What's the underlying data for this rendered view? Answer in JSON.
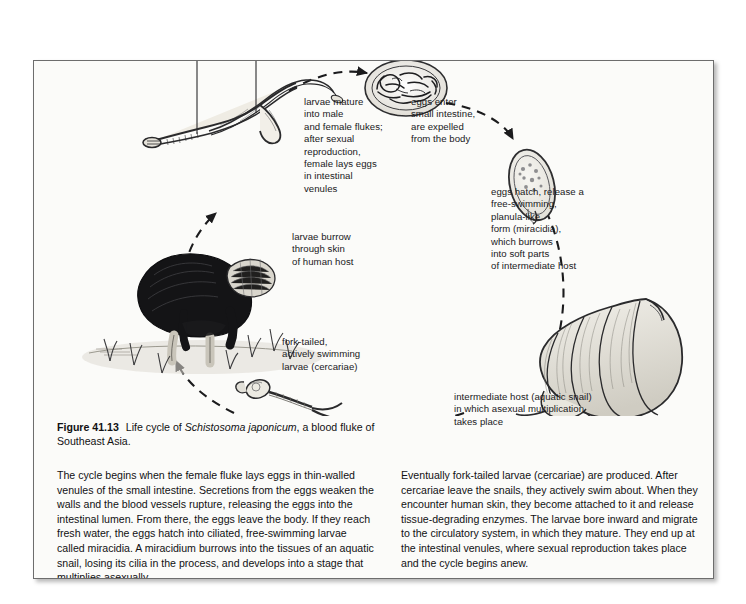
{
  "figure": {
    "number": "Figure 41.13",
    "title_plain_before": "Life cycle of ",
    "species": "Schistosoma japonicum",
    "title_plain_after": ", a blood fluke of Southeast Asia."
  },
  "diagram": {
    "labels": {
      "male": "male",
      "female": "female",
      "larvae_mature": "larvae mature\ninto male\nand female flukes;\nafter sexual\nreproduction,\nfemale lays eggs\nin intestinal\nvenules",
      "eggs_enter": "eggs enter\nsmall intestine,\nare expelled\nfrom the body",
      "eggs_hatch": "eggs hatch, release a\nfree-swimming,\nplanula-like\nform (miracidia),\nwhich burrows\ninto soft parts\nof intermediate host",
      "larvae_burrow": "larvae burrow\nthrough skin\nof human host",
      "cercariae": "fork-tailed,\nactively swimming\nlarvae (cercariae)",
      "snail": "intermediate host (aquatic snail)\nin which asexual multiplication\ntakes place"
    },
    "illustrations": {
      "adult_flukes": "adult-flukes-illustration",
      "intestine_cross_section": "intestine-cross-section-illustration",
      "egg": "egg-illustration",
      "human_host": "human-host-illustration",
      "snail": "snail-illustration",
      "cercaria": "cercaria-illustration"
    },
    "colors": {
      "ink": "#19191b",
      "page": "#fbfbf9",
      "border": "#6d6d6d"
    }
  },
  "body": {
    "left": "The cycle begins when the female fluke lays eggs in thin-walled venules of the small intestine. Secretions from the eggs weaken the walls and the blood vessels rupture, releasing the eggs into the intestinal lumen. From there, the eggs leave the body. If they reach fresh water, the eggs hatch into ciliated, free-swimming larvae called miracidia. A miracidium burrows into the tissues of an aquatic snail, losing its cilia in the process, and develops into a stage that multiplies asexually.",
    "right": "Eventually fork-tailed larvae (cercariae) are produced. After cercariae leave the snails, they actively swim about. When they encounter human skin, they become attached to it and release tissue-degrading enzymes. The larvae bore inward and migrate to the circulatory system, in which they mature. They end up at the intestinal venules, where sexual reproduction takes place and the cycle begins anew."
  }
}
